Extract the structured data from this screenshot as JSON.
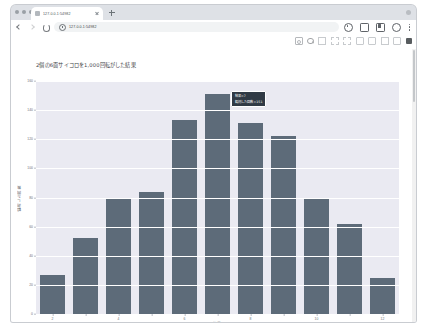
{
  "browser": {
    "tab": {
      "title": "127.0.0.1:54982",
      "favicon": "page-favicon",
      "close": "×"
    },
    "new_tab_label": "+",
    "omnibox": {
      "url": "127.0.0.1:54982",
      "placeholder": "Search or type URL"
    },
    "nav": {
      "back": "back-arrow",
      "forward": "forward-arrow",
      "reload": "reload-arrow",
      "settings": "gear-icon",
      "cast": "cast-icon",
      "extensions": "extensions-icon",
      "profile": "profile-icon",
      "menu": "kebab-menu-icon"
    }
  },
  "modebar": {
    "items": [
      "camera-icon",
      "zoom-icon",
      "pan-icon",
      "zoom-in-icon",
      "zoom-out-icon",
      "autoscale-icon",
      "reset-axes-icon",
      "toggle-spike-icon",
      "compare-data-icon",
      "plotly-logo-icon"
    ]
  },
  "chart_data": {
    "type": "bar",
    "title": "2個の6面サイコロを1,000回転がした結果",
    "xlabel": "結果",
    "ylabel": "観測した回数",
    "categories": [
      2,
      3,
      4,
      5,
      6,
      7,
      8,
      9,
      10,
      11,
      12
    ],
    "values": [
      27,
      52,
      79,
      84,
      133,
      151,
      131,
      122,
      79,
      62,
      25
    ],
    "ylim": [
      0,
      160
    ],
    "yticks": [
      0,
      20,
      40,
      60,
      80,
      100,
      120,
      140,
      160
    ],
    "xticks": [
      2,
      4,
      6,
      8,
      10,
      12
    ],
    "grid": true,
    "legend": false,
    "bar_color": "#5d6b79",
    "plot_bg": "#eaeaf2",
    "paper_bg": "#ffffff"
  },
  "tooltip": {
    "line1": "結果=7",
    "line2": "観測した回数=151",
    "bg": "#303a45",
    "fg": "#ffffff"
  }
}
